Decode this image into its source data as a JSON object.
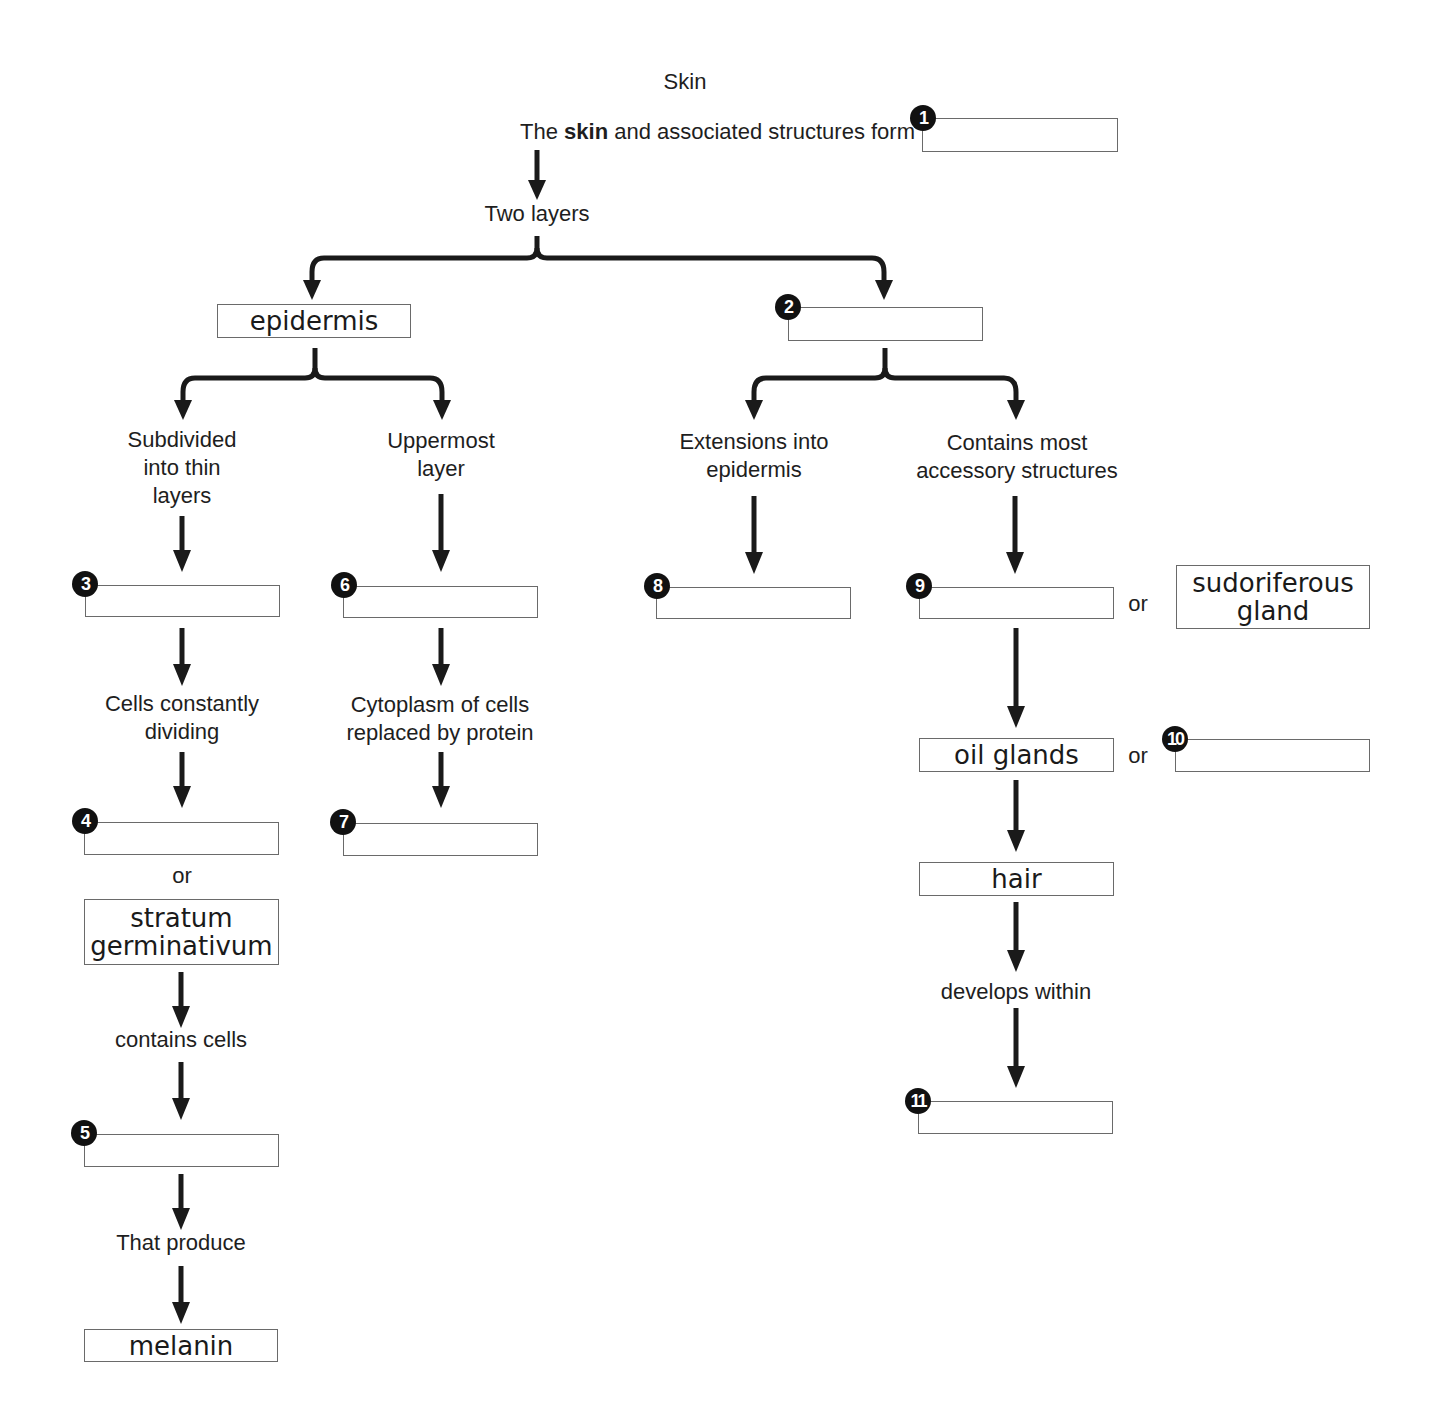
{
  "title": "Skin",
  "intro": {
    "prefix": "The ",
    "bold": "skin",
    "suffix": " and associated structures form"
  },
  "nodes": {
    "two_layers": "Two layers",
    "epidermis": "epidermis",
    "subdivided": [
      "Subdivided",
      "into thin",
      "layers"
    ],
    "uppermost": [
      "Uppermost",
      "layer"
    ],
    "extensions": [
      "Extensions into",
      "epidermis"
    ],
    "contains_most": [
      "Contains most",
      "accessory structures"
    ],
    "cells_dividing": [
      "Cells constantly",
      "dividing"
    ],
    "cytoplasm": [
      "Cytoplasm of cells",
      "replaced by protein"
    ],
    "or": "or",
    "stratum": [
      "stratum",
      "germinativum"
    ],
    "contains_cells": "contains cells",
    "that_produce": "That produce",
    "melanin": "melanin",
    "sudoriferous": [
      "sudoriferous",
      "gland"
    ],
    "oil_glands": "oil glands",
    "hair": "hair",
    "develops_within": "develops within"
  },
  "blanks": [
    {
      "number": "1",
      "value": ""
    },
    {
      "number": "2",
      "value": ""
    },
    {
      "number": "3",
      "value": ""
    },
    {
      "number": "4",
      "value": ""
    },
    {
      "number": "5",
      "value": ""
    },
    {
      "number": "6",
      "value": ""
    },
    {
      "number": "7",
      "value": ""
    },
    {
      "number": "8",
      "value": ""
    },
    {
      "number": "9",
      "value": ""
    },
    {
      "number": "10",
      "value": ""
    },
    {
      "number": "11",
      "value": ""
    }
  ]
}
